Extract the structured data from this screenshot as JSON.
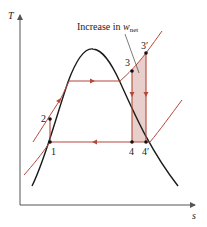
{
  "diagram": {
    "type": "T-s diagram (Rankine cycle, superheat effect)",
    "axes": {
      "y_label": "T",
      "x_label": "s"
    },
    "annotation": {
      "text": "Increase in ",
      "symbol": "w",
      "subscript": "net"
    },
    "points": [
      {
        "id": "1",
        "label": "1"
      },
      {
        "id": "2",
        "label": "2"
      },
      {
        "id": "3",
        "label": "3"
      },
      {
        "id": "3p",
        "label": "3′"
      },
      {
        "id": "4",
        "label": "4"
      },
      {
        "id": "4p",
        "label": "4′"
      }
    ],
    "colors": {
      "dome": "#1a1a1a",
      "cycle": "#b5473a",
      "shaded_area": "#e8cfcb",
      "axes": "#555555"
    }
  }
}
